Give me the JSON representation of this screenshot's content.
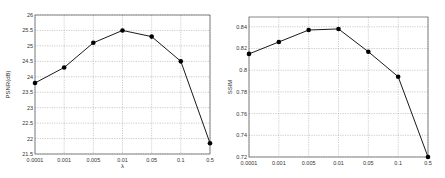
{
  "chart_data": [
    {
      "type": "line",
      "title": "",
      "xlabel": "λ",
      "ylabel": "PSNR(dB)",
      "categories": [
        "0.0001",
        "0.001",
        "0.005",
        "0.01",
        "0.05",
        "0.1",
        "0.5"
      ],
      "series": [
        {
          "name": "PSNR",
          "values": [
            23.8,
            24.3,
            25.1,
            25.5,
            25.3,
            24.5,
            21.85
          ]
        }
      ],
      "ylim": [
        21.5,
        26
      ],
      "yticks": [
        "21.5",
        "22",
        "22.5",
        "23",
        "23.5",
        "24",
        "24.5",
        "25",
        "25.5",
        "26"
      ],
      "grid": true,
      "legend": "none",
      "marker": "circle",
      "color": "#000000"
    },
    {
      "type": "line",
      "title": "",
      "xlabel": "",
      "ylabel": "SSIM",
      "categories": [
        "0.0001",
        "0.001",
        "0.005",
        "0.01",
        "0.05",
        "0.1",
        "0.5"
      ],
      "series": [
        {
          "name": "SSIM",
          "values": [
            0.815,
            0.826,
            0.837,
            0.838,
            0.817,
            0.794,
            0.72
          ]
        }
      ],
      "ylim": [
        0.72,
        0.849
      ],
      "yticks": [
        "0.72",
        "0.74",
        "0.76",
        "0.78",
        "0.8",
        "0.82",
        "0.84"
      ],
      "grid": true,
      "legend": "none",
      "marker": "circle",
      "color": "#000000"
    }
  ]
}
